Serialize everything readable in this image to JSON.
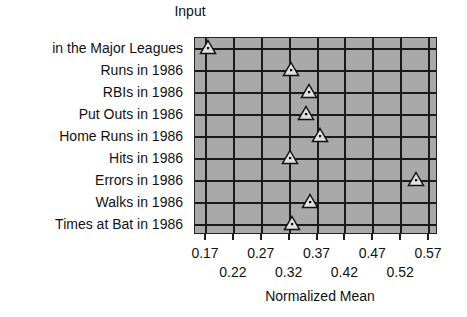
{
  "chart_data": {
    "type": "scatter",
    "title": "Input",
    "xlabel": "Normalized Mean",
    "ylabel": "",
    "xlim": [
      0.151,
      0.586
    ],
    "grid": true,
    "marker": "triangle",
    "colors": {
      "plot_background": "#a9a9a9",
      "grid": "#1a1a1a",
      "marker_fill": "#e0e0e0",
      "marker_edge": "#111111"
    },
    "x_ticks_row1": [
      "0.17",
      "0.27",
      "0.37",
      "0.47",
      "0.57"
    ],
    "x_ticks_row2": [
      "0.22",
      "0.32",
      "0.42",
      "0.52"
    ],
    "categories": [
      "in the Major Leagues",
      "Runs in 1986",
      "RBIs in 1986",
      "Put Outs in 1986",
      "Home Runs in 1986",
      "Hits in 1986",
      "Errors in 1986",
      "Walks in 1986",
      "Times at Bat in 1986"
    ],
    "values": [
      0.175,
      0.324,
      0.357,
      0.351,
      0.376,
      0.322,
      0.548,
      0.358,
      0.326
    ]
  }
}
